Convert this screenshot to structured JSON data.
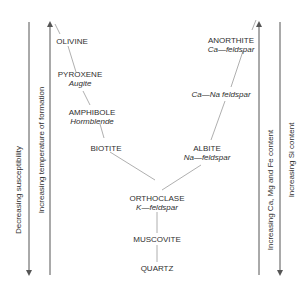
{
  "diagram": {
    "left_axes": [
      {
        "label": "Decreasing susceptibility",
        "direction": "down"
      },
      {
        "label": "Increasing temperature of formation",
        "direction": "up"
      }
    ],
    "right_axes": [
      {
        "label": "Increasing Ca, Mg and Fe content",
        "direction": "up"
      },
      {
        "label": "Increasing Si content",
        "direction": "down"
      }
    ],
    "discontinuous_series": [
      {
        "name": "OLIVINE",
        "sub": ""
      },
      {
        "name": "PYROXENE",
        "sub": "Augite"
      },
      {
        "name": "AMPHIBOLE",
        "sub": "Hormblende"
      },
      {
        "name": "BIOTITE",
        "sub": ""
      }
    ],
    "continuous_series": [
      {
        "name": "ANORTHITE",
        "sub": "Ca—feldspar"
      },
      {
        "name": "",
        "sub": "Ca—Na feldspar"
      },
      {
        "name": "ALBITE",
        "sub": "Na—feldspar"
      }
    ],
    "merged_series": [
      {
        "name": "ORTHOCLASE",
        "sub": "K—feldspar"
      },
      {
        "name": "MUSCOVITE",
        "sub": ""
      },
      {
        "name": "QUARTZ",
        "sub": ""
      }
    ],
    "colors": {
      "axis": "#555555",
      "connector": "#9a9a9a",
      "text": "#2f2f2f"
    }
  }
}
